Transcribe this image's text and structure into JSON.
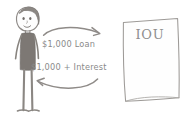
{
  "diagram": {
    "style": "hand-drawn pencil sketch on white paper",
    "background_color": "#ffffff",
    "ink_color": "#8a8a8a",
    "figure_fill_color": "#7a7572",
    "person": {
      "name": "borrower-stick-figure",
      "description": "stick figure person with rounded head, hair, eyes, smile, dark shaded torso, thin legs and feet"
    },
    "document": {
      "name": "iou-paper",
      "label": "IOU",
      "description": "wavy rectangular sheet of paper with IOU written at the top"
    },
    "arrows": [
      {
        "name": "loan-arrow",
        "direction": "left-to-right",
        "label": "$1,000 Loan"
      },
      {
        "name": "repayment-arrow",
        "direction": "right-to-left",
        "label": "$1,000 + Interest"
      }
    ]
  }
}
